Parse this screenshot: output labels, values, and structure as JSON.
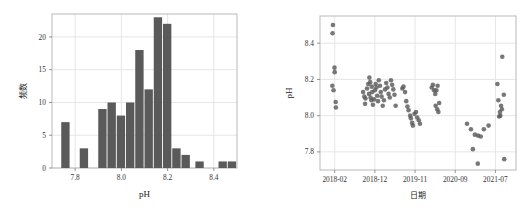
{
  "figure": {
    "background_color": "#ffffff",
    "panel_count": 2,
    "mark_color": "#5a5a5a",
    "grid_color": "#e3e3e3",
    "border_color": "#b9b9b9"
  },
  "chart_data": [
    {
      "id": "ph-histogram",
      "type": "bar",
      "title": "",
      "xlabel": "pH",
      "ylabel": "频数",
      "xlim": [
        7.7,
        8.5
      ],
      "ylim": [
        0,
        23.5
      ],
      "xticks": [
        7.8,
        8.0,
        8.2,
        8.4
      ],
      "xticklabels": [
        "7.8",
        "8.0",
        "8.2",
        "8.4"
      ],
      "yticks": [
        0,
        5,
        10,
        15,
        20
      ],
      "yticklabels": [
        "0",
        "5",
        "10",
        "15",
        "20"
      ],
      "grid": true,
      "legend": "none",
      "bar_color": "#5a5a5a",
      "bin_width": 0.04,
      "bin_starts": [
        7.74,
        7.82,
        7.9,
        7.94,
        7.98,
        8.02,
        8.06,
        8.1,
        8.14,
        8.18,
        8.22,
        8.26,
        8.32,
        8.42,
        8.46
      ],
      "categories": [
        "7.74",
        "7.82",
        "7.90",
        "7.94",
        "7.98",
        "8.02",
        "8.06",
        "8.10",
        "8.14",
        "8.18",
        "8.22",
        "8.26",
        "8.32",
        "8.42",
        "8.46"
      ],
      "values": [
        7,
        3,
        9,
        10,
        8,
        10,
        18,
        12,
        23,
        22,
        3,
        2,
        1,
        1,
        1
      ]
    },
    {
      "id": "ph-timeseries",
      "type": "scatter",
      "title": "",
      "xlabel": "日期",
      "ylabel": "pH",
      "xlim": [
        0,
        100
      ],
      "ylim": [
        7.7,
        8.55
      ],
      "xticks": [
        7.5,
        28.0,
        48.5,
        69.0,
        89.5
      ],
      "xticklabels": [
        "2018-02",
        "2018-12",
        "2019-11",
        "2020-09",
        "2021-07"
      ],
      "yticks": [
        7.8,
        8.0,
        8.2,
        8.4
      ],
      "yticklabels": [
        "7.8",
        "8.0",
        "8.2",
        "8.4"
      ],
      "grid": true,
      "legend": "none",
      "marker_color": "#5a5a5a",
      "marker_size": 4.6,
      "points": [
        {
          "x": 6.6,
          "y": 8.5
        },
        {
          "x": 6.4,
          "y": 8.455
        },
        {
          "x": 7.4,
          "y": 8.265
        },
        {
          "x": 7.5,
          "y": 8.24
        },
        {
          "x": 6.3,
          "y": 8.165
        },
        {
          "x": 6.9,
          "y": 8.14
        },
        {
          "x": 8.0,
          "y": 8.075
        },
        {
          "x": 8.1,
          "y": 8.045
        },
        {
          "x": 22.0,
          "y": 8.13
        },
        {
          "x": 22.6,
          "y": 8.105
        },
        {
          "x": 23.2,
          "y": 8.095
        },
        {
          "x": 23.0,
          "y": 8.065
        },
        {
          "x": 24.0,
          "y": 8.15
        },
        {
          "x": 24.6,
          "y": 8.175
        },
        {
          "x": 25.2,
          "y": 8.21
        },
        {
          "x": 25.6,
          "y": 8.185
        },
        {
          "x": 25.0,
          "y": 8.12
        },
        {
          "x": 25.8,
          "y": 8.1
        },
        {
          "x": 26.4,
          "y": 8.16
        },
        {
          "x": 26.6,
          "y": 8.13
        },
        {
          "x": 26.2,
          "y": 8.085
        },
        {
          "x": 27.0,
          "y": 8.06
        },
        {
          "x": 27.6,
          "y": 8.09
        },
        {
          "x": 28.0,
          "y": 8.14
        },
        {
          "x": 28.4,
          "y": 8.175
        },
        {
          "x": 28.8,
          "y": 8.155
        },
        {
          "x": 29.2,
          "y": 8.11
        },
        {
          "x": 29.6,
          "y": 8.08
        },
        {
          "x": 30.0,
          "y": 8.195
        },
        {
          "x": 30.6,
          "y": 8.165
        },
        {
          "x": 31.0,
          "y": 8.13
        },
        {
          "x": 31.4,
          "y": 8.105
        },
        {
          "x": 32.0,
          "y": 8.055
        },
        {
          "x": 32.6,
          "y": 8.085
        },
        {
          "x": 33.2,
          "y": 8.145
        },
        {
          "x": 33.8,
          "y": 8.18
        },
        {
          "x": 34.4,
          "y": 8.155
        },
        {
          "x": 35.0,
          "y": 8.12
        },
        {
          "x": 35.6,
          "y": 8.1
        },
        {
          "x": 36.2,
          "y": 8.195
        },
        {
          "x": 36.8,
          "y": 8.17
        },
        {
          "x": 37.4,
          "y": 8.145
        },
        {
          "x": 38.0,
          "y": 8.115
        },
        {
          "x": 38.6,
          "y": 8.055
        },
        {
          "x": 42.0,
          "y": 8.15
        },
        {
          "x": 42.6,
          "y": 8.16
        },
        {
          "x": 43.4,
          "y": 8.13
        },
        {
          "x": 44.0,
          "y": 8.08
        },
        {
          "x": 44.6,
          "y": 8.05
        },
        {
          "x": 45.2,
          "y": 8.03
        },
        {
          "x": 46.0,
          "y": 8.0
        },
        {
          "x": 46.4,
          "y": 7.985
        },
        {
          "x": 47.0,
          "y": 7.96
        },
        {
          "x": 47.4,
          "y": 7.945
        },
        {
          "x": 48.2,
          "y": 8.01
        },
        {
          "x": 49.0,
          "y": 8.02
        },
        {
          "x": 49.6,
          "y": 7.99
        },
        {
          "x": 50.4,
          "y": 7.975
        },
        {
          "x": 51.0,
          "y": 7.955
        },
        {
          "x": 57.0,
          "y": 8.155
        },
        {
          "x": 57.6,
          "y": 8.17
        },
        {
          "x": 58.2,
          "y": 8.14
        },
        {
          "x": 58.8,
          "y": 8.12
        },
        {
          "x": 59.4,
          "y": 8.14
        },
        {
          "x": 60.0,
          "y": 8.165
        },
        {
          "x": 59.0,
          "y": 8.055
        },
        {
          "x": 59.8,
          "y": 8.035
        },
        {
          "x": 60.4,
          "y": 8.02
        },
        {
          "x": 60.8,
          "y": 8.07
        },
        {
          "x": 75.0,
          "y": 7.955
        },
        {
          "x": 77.0,
          "y": 7.925
        },
        {
          "x": 79.0,
          "y": 7.895
        },
        {
          "x": 80.6,
          "y": 7.89
        },
        {
          "x": 82.0,
          "y": 7.885
        },
        {
          "x": 83.6,
          "y": 7.925
        },
        {
          "x": 86.0,
          "y": 7.945
        },
        {
          "x": 78.0,
          "y": 7.815
        },
        {
          "x": 80.5,
          "y": 7.735
        },
        {
          "x": 93.0,
          "y": 8.325
        },
        {
          "x": 90.5,
          "y": 8.175
        },
        {
          "x": 93.8,
          "y": 8.115
        },
        {
          "x": 91.0,
          "y": 8.085
        },
        {
          "x": 92.4,
          "y": 8.055
        },
        {
          "x": 92.8,
          "y": 8.035
        },
        {
          "x": 91.8,
          "y": 8.02
        },
        {
          "x": 91.4,
          "y": 7.995
        },
        {
          "x": 92.0,
          "y": 8.0
        },
        {
          "x": 94.0,
          "y": 7.76
        }
      ]
    }
  ]
}
